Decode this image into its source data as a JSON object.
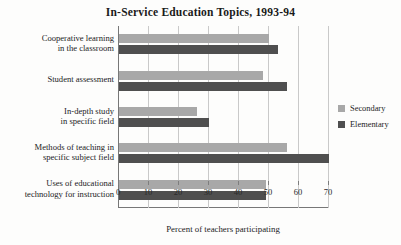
{
  "chart_data": {
    "type": "bar",
    "orientation": "horizontal",
    "title": "In-Service Education Topics, 1993-94",
    "xlabel": "Percent of teachers participating",
    "ylabel": "",
    "xlim": [
      0,
      70
    ],
    "xticks": [
      0,
      10,
      20,
      30,
      40,
      50,
      60,
      70
    ],
    "xtick_labels": [
      "0",
      "10",
      "20",
      "30",
      "40",
      "50",
      "60",
      "70"
    ],
    "grid": true,
    "legend_position": "right",
    "categories": [
      "Cooperative learning\nin the classroom",
      "Student assessment",
      "In-depth study\nin specific field",
      "Methods of teaching in\nspecific subject field",
      "Uses of educational\ntechnology for instruction"
    ],
    "series": [
      {
        "name": "Secondary",
        "color": "#a8a8a8",
        "values": [
          50,
          48,
          26,
          56,
          49
        ]
      },
      {
        "name": "Elementary",
        "color": "#4f4f4f",
        "values": [
          53,
          56,
          30,
          70,
          49
        ]
      }
    ]
  },
  "legend": {
    "items": [
      {
        "label": "Secondary"
      },
      {
        "label": "Elementary"
      }
    ]
  }
}
